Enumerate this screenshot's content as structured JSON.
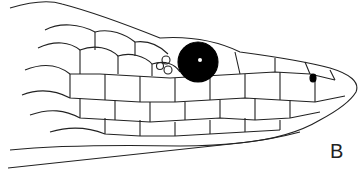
{
  "figure": {
    "panel_label": "B",
    "colors": {
      "line": "#222222",
      "eye": "#000000",
      "background": "#ffffff"
    }
  }
}
